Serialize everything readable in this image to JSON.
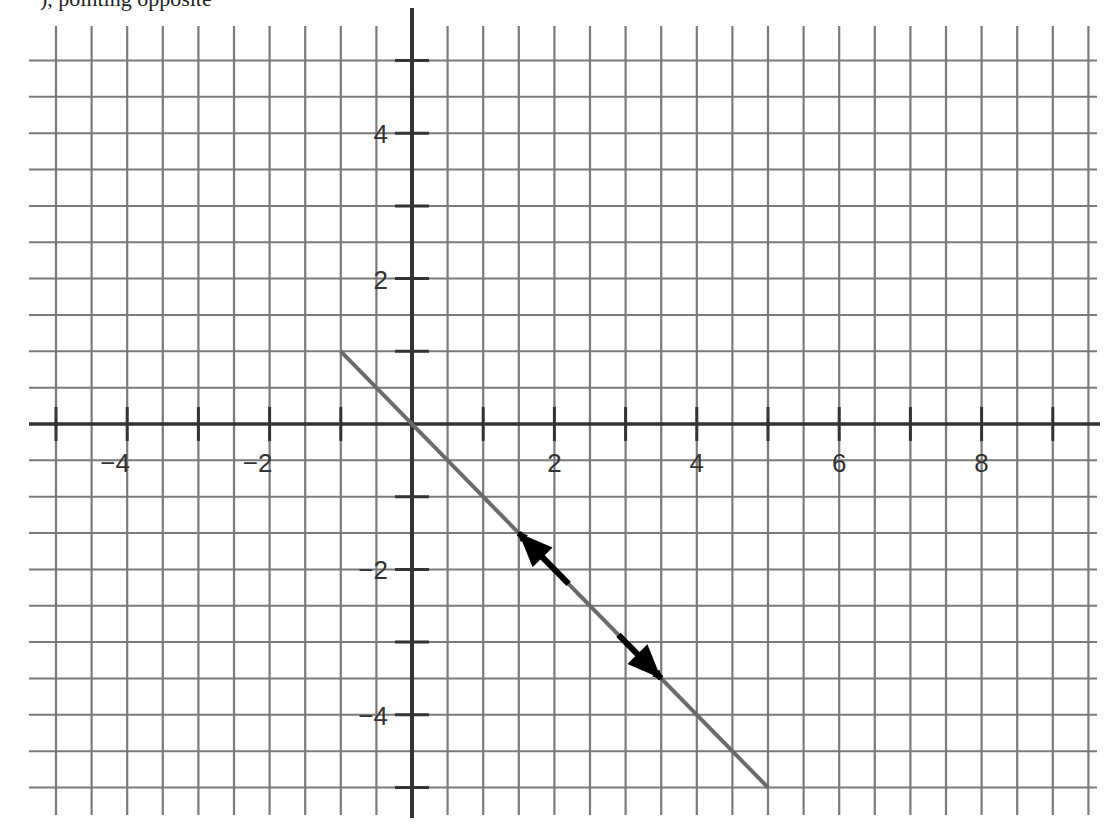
{
  "caption_fragment": "), pointing opposite",
  "chart_data": {
    "type": "line",
    "title": "",
    "xlabel": "",
    "ylabel": "",
    "xlim": [
      -5,
      9.5
    ],
    "ylim": [
      -5,
      5
    ],
    "grid": true,
    "grid_step": 0.5,
    "x_ticks": [
      -4,
      -2,
      2,
      4,
      6,
      8
    ],
    "x_tick_labels": [
      "−4",
      "−2",
      "2",
      "4",
      "6",
      "8"
    ],
    "y_ticks": [
      4,
      2,
      -2,
      -4
    ],
    "y_tick_labels": [
      "4",
      "2",
      "−2",
      "−4"
    ],
    "series": [
      {
        "name": "line y = -x",
        "x": [
          -1,
          5
        ],
        "y": [
          1,
          -5
        ],
        "color": "#6b6b6b"
      }
    ],
    "annotations": [
      {
        "type": "arrow",
        "from": [
          2.2,
          -2.2
        ],
        "to": [
          1.5,
          -1.5
        ],
        "color": "#000000",
        "label": "direction vector up-left"
      },
      {
        "type": "arrow",
        "from": [
          2.9,
          -2.9
        ],
        "to": [
          3.5,
          -3.5
        ],
        "color": "#000000",
        "label": "direction vector down-right"
      }
    ]
  },
  "colors": {
    "grid": "#7a7a7a",
    "axis": "#333333",
    "line": "#6b6b6b",
    "arrow": "#000000"
  }
}
